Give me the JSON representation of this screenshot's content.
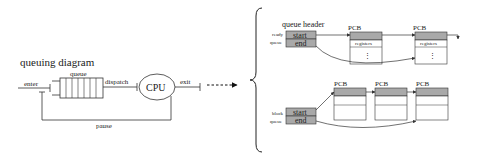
{
  "queuing_diagram": {
    "title": "queuing diagram",
    "labels": {
      "enter": "enter",
      "queue": "queue",
      "dispatch": "dispatch",
      "cpu": "CPU",
      "exit": "exit",
      "pause": "pause"
    },
    "queue_slots": 7
  },
  "ready_queue": {
    "header_label": "queue header",
    "name_line1": "ready",
    "name_line2": "queue",
    "start": "start",
    "end": "end",
    "pcbs": [
      {
        "label": "PCB",
        "field": "registers",
        "ellipsis": "⋮"
      },
      {
        "label": "PCB",
        "field": "registers",
        "ellipsis": "⋮"
      }
    ]
  },
  "block_queue": {
    "name_line1": "block",
    "name_line2": "queue",
    "start": "start",
    "end": "end",
    "pcbs": [
      {
        "label": "PCB"
      },
      {
        "label": "PCB"
      },
      {
        "label": "PCB"
      }
    ]
  },
  "colors": {
    "header_fill": "#a9a9a9",
    "line": "#333333",
    "background": "#ffffff"
  }
}
